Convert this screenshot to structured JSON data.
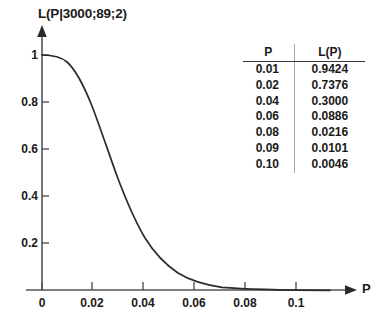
{
  "figure": {
    "title": "L(P|3000;89;2)",
    "x_axis_name": "P",
    "y_ticks": [
      "1",
      "0.8",
      "0.6",
      "0.4",
      "0.2"
    ],
    "x_ticks": [
      "0",
      "0.02",
      "0.04",
      "0.06",
      "0.08",
      "0.1"
    ],
    "axis_color": "#555555",
    "curve_color": "#2b2b2b",
    "table_rule_color": "#3a3a3a",
    "table_divider_color": "#a9a9a9"
  },
  "table": {
    "headers": [
      "P",
      "L(P)"
    ],
    "rows": [
      {
        "p": "0.01",
        "lp": "0.9424"
      },
      {
        "p": "0.02",
        "lp": "0.7376"
      },
      {
        "p": "0.04",
        "lp": "0.3000"
      },
      {
        "p": "0.06",
        "lp": "0.0886"
      },
      {
        "p": "0.08",
        "lp": "0.0216"
      },
      {
        "p": "0.09",
        "lp": "0.0101"
      },
      {
        "p": "0.10",
        "lp": "0.0046"
      }
    ]
  },
  "chart_data": {
    "type": "line",
    "title": "L(P|3000;89;2)",
    "xlabel": "P",
    "ylabel": "L(P|3000;89;2)",
    "xlim": [
      0,
      0.112
    ],
    "ylim": [
      0,
      1.06
    ],
    "xticks": [
      0,
      0.02,
      0.04,
      0.06,
      0.08,
      0.1
    ],
    "xticklabels": [
      "0",
      "0.02",
      "0.04",
      "0.06",
      "0.08",
      "0.1"
    ],
    "yticks": [
      0.2,
      0.4,
      0.6,
      0.8,
      1
    ],
    "yticklabels": [
      "0.2",
      "0.4",
      "0.6",
      "0.8",
      "1"
    ],
    "grid": false,
    "legend": false,
    "series": [
      {
        "name": "L(P)",
        "x": [
          0,
          0.002,
          0.004,
          0.006,
          0.008,
          0.01,
          0.012,
          0.014,
          0.016,
          0.018,
          0.02,
          0.022,
          0.024,
          0.026,
          0.028,
          0.03,
          0.032,
          0.034,
          0.036,
          0.038,
          0.04,
          0.042,
          0.044,
          0.046,
          0.048,
          0.05,
          0.055,
          0.06,
          0.065,
          0.07,
          0.075,
          0.08,
          0.085,
          0.09,
          0.095,
          0.1,
          0.105,
          0.112
        ],
        "y": [
          1.0,
          0.9999,
          0.9993,
          0.9975,
          0.9932,
          0.9424,
          0.958,
          0.928,
          0.889,
          0.842,
          0.7376,
          0.731,
          0.667,
          0.6,
          0.532,
          0.465,
          0.401,
          0.341,
          0.287,
          0.239,
          0.3,
          0.162,
          0.131,
          0.105,
          0.083,
          0.065,
          0.036,
          0.0886,
          0.032,
          0.017,
          0.0132,
          0.0216,
          0.015,
          0.0101,
          0.007,
          0.0046,
          0.003,
          0.0018
        ]
      }
    ],
    "annotated_points": {
      "P": [
        0.01,
        0.02,
        0.04,
        0.06,
        0.08,
        0.09,
        0.1
      ],
      "L(P)": [
        0.9424,
        0.7376,
        0.3,
        0.0886,
        0.0216,
        0.0101,
        0.0046
      ]
    }
  }
}
